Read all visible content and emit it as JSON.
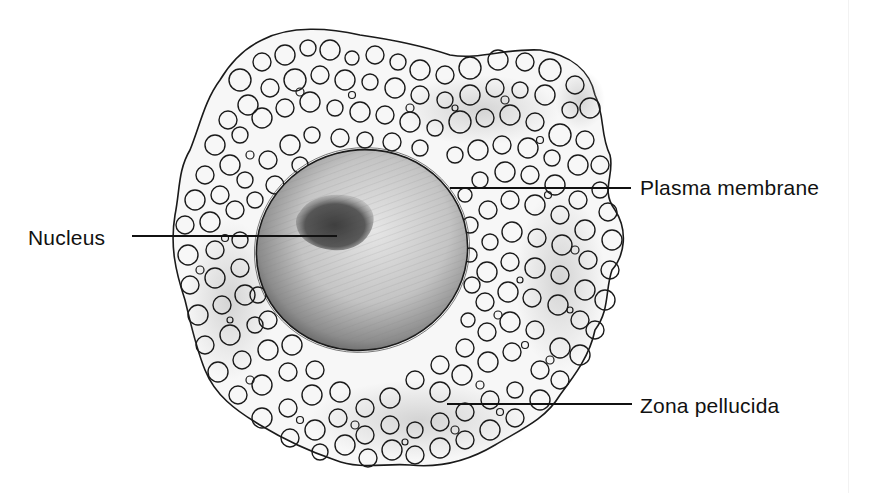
{
  "figure": {
    "labels": [
      {
        "id": "nucleus",
        "text": "Nucleus"
      },
      {
        "id": "plasma-membrane",
        "text": "Plasma membrane"
      },
      {
        "id": "zona-pellucida",
        "text": "Zona pellucida"
      }
    ]
  },
  "colors": {
    "background": "#ffffff",
    "ink": "#111111",
    "shading": "#9a9a9a",
    "nucleus": "#3c3c3c"
  }
}
